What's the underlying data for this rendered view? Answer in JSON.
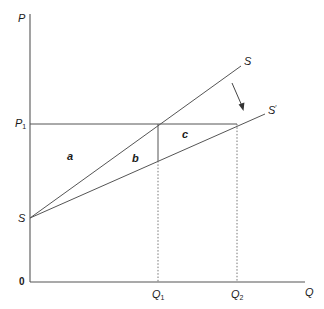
{
  "diagram": {
    "type": "supply-shift economics diagram",
    "axes": {
      "y_label": "P",
      "x_label": "Q",
      "origin_label": "0"
    },
    "price_levels": [
      {
        "name": "P1",
        "label_main": "P",
        "label_sub": "1"
      }
    ],
    "quantity_levels": [
      {
        "name": "Q1",
        "label_main": "Q",
        "label_sub": "1"
      },
      {
        "name": "Q2",
        "label_main": "Q",
        "label_sub": "2"
      }
    ],
    "curves": [
      {
        "name": "S",
        "label": "S",
        "description": "original supply curve"
      },
      {
        "name": "S-prime",
        "label_main": "S",
        "label_sup": "′",
        "description": "shifted supply curve"
      }
    ],
    "intercept_label": "S",
    "regions": [
      {
        "name": "a",
        "label": "a"
      },
      {
        "name": "b",
        "label": "b"
      },
      {
        "name": "c",
        "label": "c"
      }
    ],
    "shift_arrow": {
      "from": "S",
      "to": "S-prime",
      "direction": "down-right"
    },
    "colors": {
      "line": "#555555",
      "text": "#1a1a1a",
      "background": "#ffffff"
    }
  }
}
